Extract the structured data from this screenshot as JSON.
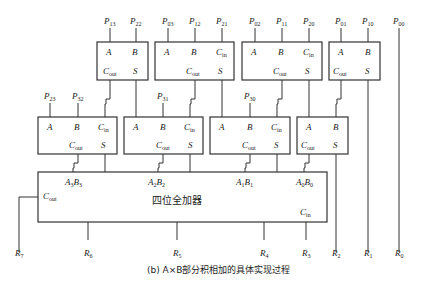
{
  "caption": "(b) A×B部分积相加的具体实现过程",
  "big_adder": {
    "label": "四位全加器",
    "cout": "C",
    "cout_sub": "out",
    "cin": "C",
    "cin_sub": "in",
    "inputs": [
      {
        "label": "A₃B₃"
      },
      {
        "label": "A₂B₂"
      },
      {
        "label": "A₁B₁"
      },
      {
        "label": "A₀B₀"
      }
    ]
  },
  "top_row_adders": [
    {
      "id": "HA_top_1",
      "type": "half",
      "inputs": {
        "A": "P13",
        "B": "P22"
      }
    },
    {
      "id": "FA_top_2",
      "type": "full",
      "inputs": {
        "A": "P03",
        "B": "P12",
        "Cin": "P21"
      }
    },
    {
      "id": "FA_top_3",
      "type": "full",
      "inputs": {
        "A": "P02",
        "B": "P11",
        "Cin": "P20"
      }
    },
    {
      "id": "HA_top_4",
      "type": "half",
      "inputs": {
        "A": "P01",
        "B": "P10"
      }
    }
  ],
  "mid_row_adders": [
    {
      "id": "FA_mid_1",
      "type": "full",
      "inputs": {
        "A": "P23",
        "B": "P32",
        "Cin": "Cout(HA_top_1)"
      }
    },
    {
      "id": "FA_mid_2",
      "type": "full",
      "inputs": {
        "A": "S(HA_top_1)",
        "B": "P31",
        "Cin": "Cout(FA_top_2)"
      }
    },
    {
      "id": "FA_mid_3",
      "type": "full",
      "inputs": {
        "A": "S(FA_top_2)",
        "B": "P30",
        "Cin": "Cout(FA_top_3)"
      }
    },
    {
      "id": "HA_mid_4",
      "type": "half",
      "inputs": {
        "A": "S(FA_top_3)",
        "B": "Cout(HA_top_4)"
      }
    }
  ],
  "port_labels": {
    "A": "A",
    "B": "B",
    "C": "C",
    "in": "in",
    "out": "out",
    "S": "S"
  },
  "top_inputs": [
    {
      "name": "P",
      "sub": "13"
    },
    {
      "name": "P",
      "sub": "22"
    },
    {
      "name": "P",
      "sub": "03"
    },
    {
      "name": "P",
      "sub": "12"
    },
    {
      "name": "P",
      "sub": "21"
    },
    {
      "name": "P",
      "sub": "02"
    },
    {
      "name": "P",
      "sub": "11"
    },
    {
      "name": "P",
      "sub": "20"
    },
    {
      "name": "P",
      "sub": "01"
    },
    {
      "name": "P",
      "sub": "10"
    },
    {
      "name": "P",
      "sub": "00"
    }
  ],
  "mid_inputs": [
    {
      "name": "P",
      "sub": "23"
    },
    {
      "name": "P",
      "sub": "32"
    },
    {
      "name": "P",
      "sub": "31"
    },
    {
      "name": "P",
      "sub": "30"
    }
  ],
  "outputs": [
    {
      "name": "R",
      "sub": "7"
    },
    {
      "name": "R",
      "sub": "6"
    },
    {
      "name": "R",
      "sub": "5"
    },
    {
      "name": "R",
      "sub": "4"
    },
    {
      "name": "R",
      "sub": "3"
    },
    {
      "name": "R",
      "sub": "2"
    },
    {
      "name": "R",
      "sub": "1"
    },
    {
      "name": "R",
      "sub": "0"
    }
  ]
}
